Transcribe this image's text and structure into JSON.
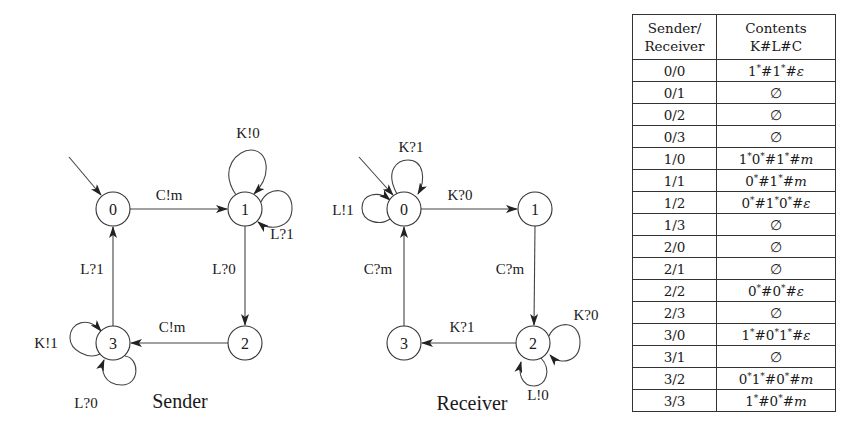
{
  "sender": {
    "caption": "Sender",
    "nodes": [
      {
        "id": "0",
        "label": "0",
        "initial": true
      },
      {
        "id": "1",
        "label": "1"
      },
      {
        "id": "2",
        "label": "2"
      },
      {
        "id": "3",
        "label": "3"
      }
    ],
    "edges": [
      {
        "from": "0",
        "to": "1",
        "label": "C!m"
      },
      {
        "from": "1",
        "to": "1",
        "label": "K!0"
      },
      {
        "from": "1",
        "to": "1",
        "label": "L?1"
      },
      {
        "from": "1",
        "to": "2",
        "label": "L?0"
      },
      {
        "from": "2",
        "to": "3",
        "label": "C!m"
      },
      {
        "from": "3",
        "to": "3",
        "label": "K!1"
      },
      {
        "from": "3",
        "to": "3",
        "label": "L?0"
      },
      {
        "from": "3",
        "to": "0",
        "label": "L?1"
      }
    ]
  },
  "receiver": {
    "caption": "Receiver",
    "nodes": [
      {
        "id": "0",
        "label": "0",
        "initial": true
      },
      {
        "id": "1",
        "label": "1"
      },
      {
        "id": "2",
        "label": "2"
      },
      {
        "id": "3",
        "label": "3"
      }
    ],
    "edges": [
      {
        "from": "0",
        "to": "0",
        "label": "K?1"
      },
      {
        "from": "0",
        "to": "0",
        "label": "L!1"
      },
      {
        "from": "0",
        "to": "1",
        "label": "K?0"
      },
      {
        "from": "1",
        "to": "2",
        "label": "C?m"
      },
      {
        "from": "2",
        "to": "2",
        "label": "K?0"
      },
      {
        "from": "2",
        "to": "2",
        "label": "L!0"
      },
      {
        "from": "2",
        "to": "3",
        "label": "K?1"
      },
      {
        "from": "3",
        "to": "0",
        "label": "C?m"
      }
    ]
  },
  "table": {
    "headers": {
      "col1_line1": "Sender/",
      "col1_line2": "Receiver",
      "col2_line1": "Contents",
      "col2_line2": "K#L#C"
    },
    "rows": [
      {
        "state": "0/0",
        "contents": "1*#1*#ε"
      },
      {
        "state": "0/1",
        "contents": "∅"
      },
      {
        "state": "0/2",
        "contents": "∅"
      },
      {
        "state": "0/3",
        "contents": "∅"
      },
      {
        "state": "1/0",
        "contents": "1*0*#1*#m"
      },
      {
        "state": "1/1",
        "contents": "0*#1*#m"
      },
      {
        "state": "1/2",
        "contents": "0*#1*0*#ε"
      },
      {
        "state": "1/3",
        "contents": "∅"
      },
      {
        "state": "2/0",
        "contents": "∅"
      },
      {
        "state": "2/1",
        "contents": "∅"
      },
      {
        "state": "2/2",
        "contents": "0*#0*#ε"
      },
      {
        "state": "2/3",
        "contents": "∅"
      },
      {
        "state": "3/0",
        "contents": "1*#0*1*#ε"
      },
      {
        "state": "3/1",
        "contents": "∅"
      },
      {
        "state": "3/2",
        "contents": "0*1*#0*#m"
      },
      {
        "state": "3/3",
        "contents": "1*#0*#m"
      }
    ]
  }
}
